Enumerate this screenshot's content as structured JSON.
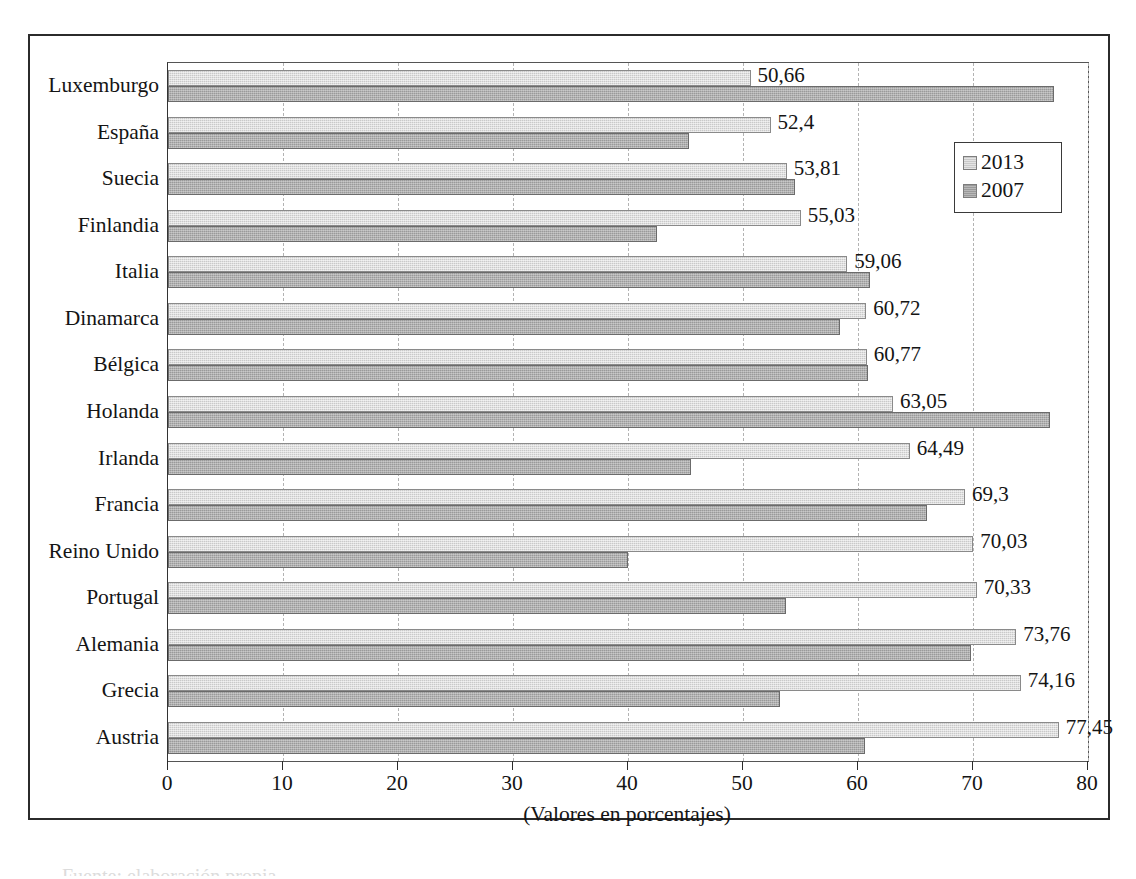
{
  "chart_data": {
    "type": "bar",
    "orientation": "horizontal",
    "title": "",
    "xlabel": "(Valores en porcentajes)",
    "ylabel": "",
    "xlim": [
      0,
      80
    ],
    "xticks": [
      0,
      10,
      20,
      30,
      40,
      50,
      60,
      70,
      80
    ],
    "xtick_labels": [
      "0",
      "10",
      "20",
      "30",
      "40",
      "50",
      "60",
      "70",
      "80"
    ],
    "grid": "vertical-dashed",
    "legend_position": "upper-right-inside",
    "categories": [
      "Luxemburgo",
      "España",
      "Suecia",
      "Finlandia",
      "Italia",
      "Dinamarca",
      "Bélgica",
      "Holanda",
      "Irlanda",
      "Francia",
      "Reino Unido",
      "Portugal",
      "Alemania",
      "Grecia",
      "Austria"
    ],
    "series": [
      {
        "name": "2013",
        "color": "#c9c9c9",
        "values": [
          50.66,
          52.4,
          53.81,
          55.03,
          59.06,
          60.72,
          60.77,
          63.05,
          64.49,
          69.3,
          70.03,
          70.33,
          73.76,
          74.16,
          77.45
        ],
        "data_labels": [
          "50,66",
          "52,4",
          "53,81",
          "55,03",
          "59,06",
          "60,72",
          "60,77",
          "63,05",
          "64,49",
          "69,3",
          "70,03",
          "70,33",
          "73,76",
          "74,16",
          "77,45"
        ]
      },
      {
        "name": "2007",
        "color": "#9a9a9a",
        "values": [
          77.0,
          45.3,
          54.5,
          42.5,
          61.0,
          58.4,
          60.9,
          76.7,
          45.5,
          66.0,
          40.0,
          53.7,
          69.8,
          53.2,
          60.6
        ],
        "data_labels": []
      }
    ]
  },
  "legend": {
    "entries": [
      {
        "label": "2013"
      },
      {
        "label": "2007"
      }
    ]
  },
  "axis": {
    "x_title": "(Valores en porcentajes)"
  },
  "caption_remnant": "Fuente: elaboración propia"
}
